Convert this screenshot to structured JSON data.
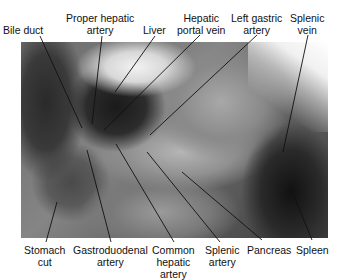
{
  "figure": {
    "photo_description": "grayscale dissection photograph of upper abdomen",
    "labels_top": [
      {
        "id": "bile-duct",
        "lines": [
          "Bile duct"
        ]
      },
      {
        "id": "proper-hepatic-artery",
        "lines": [
          "Proper hepatic",
          "artery"
        ]
      },
      {
        "id": "liver",
        "lines": [
          "Liver"
        ]
      },
      {
        "id": "hepatic-portal-vein",
        "lines": [
          "Hepatic",
          "portal vein"
        ]
      },
      {
        "id": "left-gastric-artery",
        "lines": [
          "Left gastric",
          "artery"
        ]
      },
      {
        "id": "splenic-vein",
        "lines": [
          "Splenic",
          "vein"
        ]
      }
    ],
    "labels_bottom": [
      {
        "id": "stomach-cut",
        "lines": [
          "Stomach",
          "cut"
        ]
      },
      {
        "id": "gastroduodenal-artery",
        "lines": [
          "Gastroduodenal",
          "artery"
        ]
      },
      {
        "id": "common-hepatic-artery",
        "lines": [
          "Common",
          "hepatic",
          "artery"
        ]
      },
      {
        "id": "splenic-artery",
        "lines": [
          "Splenic",
          "artery"
        ]
      },
      {
        "id": "pancreas",
        "lines": [
          "Pancreas"
        ]
      },
      {
        "id": "spleen",
        "lines": [
          "Spleen"
        ]
      }
    ]
  }
}
